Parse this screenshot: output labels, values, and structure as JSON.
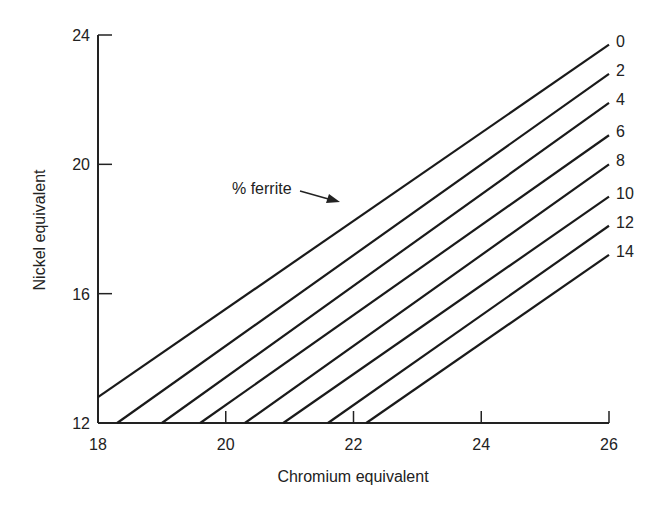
{
  "chart_data": {
    "type": "line",
    "title": "",
    "xlabel": "Chromium equivalent",
    "ylabel": "Nickel equivalent",
    "xlim": [
      18,
      26
    ],
    "ylim": [
      12,
      24
    ],
    "xticks": [
      18,
      20,
      22,
      24,
      26
    ],
    "yticks": [
      12,
      16,
      20,
      24
    ],
    "grid": false,
    "annotation": {
      "text": "% ferrite",
      "points_to_series": "0"
    },
    "series": [
      {
        "name": "0",
        "x": [
          18.0,
          26.0
        ],
        "y": [
          12.8,
          23.7
        ]
      },
      {
        "name": "2",
        "x": [
          18.3,
          26.0
        ],
        "y": [
          12.0,
          22.8
        ]
      },
      {
        "name": "4",
        "x": [
          19.0,
          26.0
        ],
        "y": [
          12.0,
          21.9
        ]
      },
      {
        "name": "6",
        "x": [
          19.6,
          26.0
        ],
        "y": [
          12.0,
          20.9
        ]
      },
      {
        "name": "8",
        "x": [
          20.3,
          26.0
        ],
        "y": [
          12.0,
          20.0
        ]
      },
      {
        "name": "10",
        "x": [
          20.9,
          26.0
        ],
        "y": [
          12.0,
          19.0
        ]
      },
      {
        "name": "12",
        "x": [
          21.6,
          26.0
        ],
        "y": [
          12.0,
          18.1
        ]
      },
      {
        "name": "14",
        "x": [
          22.2,
          26.0
        ],
        "y": [
          12.0,
          17.2
        ]
      }
    ]
  }
}
